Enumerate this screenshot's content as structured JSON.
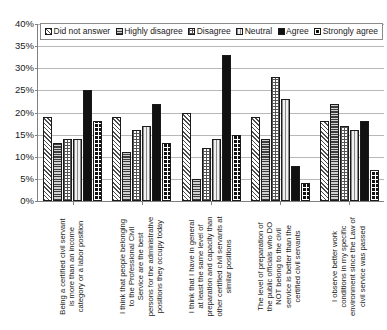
{
  "chart_data": {
    "type": "bar",
    "title": "",
    "xlabel": "",
    "ylabel": "",
    "ylim": [
      0,
      40
    ],
    "ytick_labels": [
      "40%",
      "35%",
      "30%",
      "25%",
      "20%",
      "15%",
      "10%",
      "5%",
      "0%"
    ],
    "ytick_values": [
      40,
      35,
      30,
      25,
      20,
      15,
      10,
      5,
      0
    ],
    "grid": true,
    "legend_position": "top",
    "categories": [
      "Being a certified civil servant is more than an income category or a labor position",
      "I think that people belonging to the Professional Civil Service are the best persons for the administrative positions they occupy today",
      "I think that I have in general at least the same level of preparation and capacity than other certified civil servants at similar positions",
      "The level of preparation of the public officials who do NOT belong to the civil service is better than the certified civil servants",
      "I observe better work conditions in my specific environment since the Law of civil service was passed"
    ],
    "category_lines": [
      [
        "Being a certified civil servant",
        "is more than an income",
        "category or a labor position"
      ],
      [
        "I think that people belonging",
        "to the Professional Civil",
        "Service are the best",
        "persons for the administrative",
        "positions they occupy today"
      ],
      [
        "I think that I have in general",
        "at least the same level of",
        "preparation and capacity than",
        "other certified civil servants at",
        "similar positions"
      ],
      [
        "The level of preparation of",
        "the public officials who DO",
        "NOT belong to the civil",
        "service is better than the",
        "certified civil servants"
      ],
      [
        "I observe better work",
        "conditions in my specific",
        "environment since the Law of",
        "civil service was passed"
      ]
    ],
    "series": [
      {
        "name": "Did not answer",
        "values": [
          19,
          19,
          20,
          19,
          18
        ]
      },
      {
        "name": "Highly disagree",
        "values": [
          13,
          11,
          5,
          14,
          22
        ]
      },
      {
        "name": "Disagree",
        "values": [
          14,
          16,
          12,
          28,
          17
        ]
      },
      {
        "name": "Neutral",
        "values": [
          14,
          17,
          14,
          23,
          16
        ]
      },
      {
        "name": "Agree",
        "values": [
          25,
          22,
          33,
          8,
          18
        ]
      },
      {
        "name": "Strongly agree",
        "values": [
          18,
          13,
          15,
          4,
          7
        ]
      }
    ]
  },
  "legend": {
    "items": [
      {
        "label": "Did not answer",
        "swatch": "swatch-diagonal-hatch"
      },
      {
        "label": "Highly disagree",
        "swatch": "swatch-horizontal-lines"
      },
      {
        "label": "Disagree",
        "swatch": "swatch-checker-small"
      },
      {
        "label": "Neutral",
        "swatch": "swatch-vertical-lines"
      },
      {
        "label": "Agree",
        "swatch": "swatch-solid-black"
      },
      {
        "label": "Strongly agree",
        "swatch": "swatch-checker-bold"
      }
    ]
  },
  "colors": {
    "axis": "#808080",
    "grid": "#b8b8b8",
    "text": "#1a1a1a",
    "agree_fill": "#111111",
    "background": "#ffffff"
  }
}
